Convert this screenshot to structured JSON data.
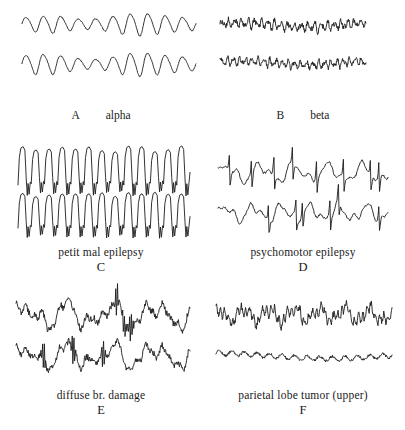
{
  "figure": {
    "background_color": "#ffffff",
    "trace_color": "#1c1c1c",
    "columns": 2,
    "rows": 3
  },
  "panels": [
    {
      "letter": "A",
      "description": "alpha",
      "layout": "inline",
      "traces": 2
    },
    {
      "letter": "B",
      "description": "beta",
      "layout": "inline",
      "traces": 2
    },
    {
      "letter": "C",
      "description": "petit mal epilepsy",
      "layout": "stacked",
      "traces": 2
    },
    {
      "letter": "D",
      "description": "psychomotor epilepsy",
      "layout": "stacked",
      "traces": 2
    },
    {
      "letter": "E",
      "description": "diffuse br. damage",
      "layout": "stacked",
      "traces": 2
    },
    {
      "letter": "F",
      "description": "parietal lobe tumor (upper)",
      "layout": "stacked",
      "traces": 2
    }
  ],
  "chart_data": {
    "type": "line",
    "xlabel": "",
    "ylabel": "",
    "grid": false,
    "legend": "none",
    "series": [
      {
        "name": "A alpha - channel 1",
        "panel": "A",
        "waveform": "sinusoidal",
        "frequency_hz": 10,
        "amplitude": 9,
        "amplitude_modulation": [
          0.75,
          0.85,
          1.0,
          0.6,
          0.55,
          0.8,
          1.15,
          1.25,
          1.0,
          0.8,
          0.65
        ],
        "x_start": 22,
        "x_end": 196,
        "baseline_y": 24
      },
      {
        "name": "A alpha - channel 2",
        "panel": "A",
        "waveform": "sinusoidal",
        "frequency_hz": 10,
        "amplitude": 9,
        "amplitude_modulation": [
          0.95,
          1.15,
          1.05,
          0.7,
          0.5,
          0.7,
          1.2,
          1.3,
          1.05,
          0.85,
          0.7
        ],
        "x_start": 22,
        "x_end": 196,
        "baseline_y": 64
      },
      {
        "name": "B beta - channel 1",
        "panel": "B",
        "waveform": "low-voltage fast",
        "frequency_hz": 22,
        "amplitude": 4,
        "amplitude_modulation": [
          1.0,
          0.85,
          1.1,
          0.9,
          1.2,
          0.8,
          1.0,
          1.15,
          0.85,
          1.0,
          0.9
        ],
        "x_start": 18,
        "x_end": 164,
        "baseline_y": 25
      },
      {
        "name": "B beta - channel 2",
        "panel": "B",
        "waveform": "low-voltage fast",
        "frequency_hz": 24,
        "amplitude": 3.5,
        "amplitude_modulation": [
          0.9,
          1.0,
          0.8,
          1.1,
          0.95,
          1.2,
          0.85,
          1.0,
          1.1,
          0.9,
          1.0
        ],
        "x_start": 18,
        "x_end": 164,
        "baseline_y": 63
      },
      {
        "name": "C petit mal epilepsy - channel 1",
        "panel": "C",
        "waveform": "spike-and-wave",
        "frequency_hz": 3,
        "amplitude": 26,
        "cycles": 13,
        "x_start": 18,
        "x_end": 190,
        "baseline_y": 30
      },
      {
        "name": "C petit mal epilepsy - channel 2",
        "panel": "C",
        "waveform": "spike-and-wave",
        "frequency_hz": 3,
        "amplitude": 24,
        "cycles": 13,
        "x_start": 18,
        "x_end": 190,
        "baseline_y": 74
      },
      {
        "name": "D psychomotor epilepsy - channel 1",
        "panel": "D",
        "waveform": "slow waves with sharp transients",
        "frequency_hz": 5,
        "amplitude": 13,
        "x_start": 16,
        "x_end": 186,
        "baseline_y": 28
      },
      {
        "name": "D psychomotor epilepsy - channel 2",
        "panel": "D",
        "waveform": "slow waves with sharp transients",
        "frequency_hz": 6,
        "amplitude": 12,
        "x_start": 16,
        "x_end": 186,
        "baseline_y": 68
      },
      {
        "name": "E diffuse br. damage - channel 1",
        "panel": "E",
        "waveform": "irregular high-voltage slow",
        "frequency_hz": 4,
        "amplitude": 18,
        "x_start": 16,
        "x_end": 190,
        "baseline_y": 27
      },
      {
        "name": "E diffuse br. damage - channel 2",
        "panel": "E",
        "waveform": "irregular high-voltage slow",
        "frequency_hz": 4,
        "amplitude": 17,
        "x_start": 16,
        "x_end": 190,
        "baseline_y": 68
      },
      {
        "name": "F parietal lobe tumor (upper) - channel 1",
        "panel": "F",
        "waveform": "mixed slow with fast overlay",
        "frequency_hz": 7,
        "amplitude": 11,
        "x_start": 14,
        "x_end": 190,
        "baseline_y": 27
      },
      {
        "name": "F parietal lobe tumor (upper) - channel 2",
        "panel": "F",
        "waveform": "flattened low-voltage",
        "frequency_hz": 14,
        "amplitude": 3,
        "x_start": 14,
        "x_end": 190,
        "baseline_y": 68
      }
    ]
  }
}
